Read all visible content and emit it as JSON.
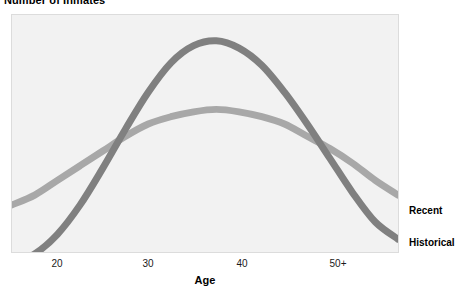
{
  "chart_data": {
    "type": "line",
    "title": "Number of Inmates",
    "xlabel": "Age",
    "ylabel": "Number of Inmates",
    "grid": false,
    "legend_position": "right-inline",
    "xticks": [
      "20",
      "30",
      "40",
      "50+"
    ],
    "xtick_positions_px": [
      57,
      148,
      242,
      338
    ],
    "x": [
      18,
      20,
      22,
      24,
      26,
      28,
      30,
      32,
      34,
      36,
      38,
      40,
      42,
      44,
      46,
      48,
      50,
      52
    ],
    "series": [
      {
        "name": "Historical",
        "color": "#808080",
        "values": [
          9,
          13,
          21,
          33,
          48,
          64,
          79,
          91,
          98,
          100,
          97,
          90,
          79,
          66,
          52,
          38,
          26,
          19
        ]
      },
      {
        "name": "Recent",
        "color": "#a8a8a8",
        "values": [
          33,
          37,
          43,
          49,
          55,
          61,
          66,
          69,
          71,
          72,
          71,
          69,
          66,
          61,
          56,
          50,
          43,
          37
        ]
      }
    ]
  },
  "axis": {
    "title": "Age",
    "ticks": [
      {
        "label": "20",
        "x": 57
      },
      {
        "label": "30",
        "x": 148
      },
      {
        "label": "40",
        "x": 242
      },
      {
        "label": "50+",
        "x": 338
      }
    ]
  },
  "legend": {
    "recent_label": "Recent",
    "historical_label": "Historical"
  },
  "colors": {
    "historical": "#808080",
    "recent": "#a8a8a8",
    "panel_background": "#f2f2f2",
    "panel_border": "#dcdcdc",
    "text": "#000000"
  }
}
